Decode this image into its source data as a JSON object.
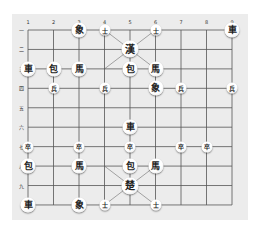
{
  "board": {
    "columns": [
      "1",
      "2",
      "3",
      "4",
      "5",
      "6",
      "7",
      "8",
      "9"
    ],
    "rows": [
      "一",
      "二",
      "三",
      "四",
      "五",
      "六",
      "七",
      "八",
      "九",
      ""
    ],
    "colors": {
      "background": "#ffffff",
      "board": "#ececec",
      "line": "#555555"
    }
  },
  "pieces": [
    {
      "label": "象",
      "col": 3,
      "row": 1,
      "side": "han",
      "size": "medium"
    },
    {
      "label": "士",
      "col": 4,
      "row": 1,
      "side": "han",
      "size": "small"
    },
    {
      "label": "士",
      "col": 6,
      "row": 1,
      "side": "han",
      "size": "small"
    },
    {
      "label": "車",
      "col": 9,
      "row": 1,
      "side": "han",
      "size": "medium"
    },
    {
      "label": "漢",
      "col": 5,
      "row": 2,
      "side": "han",
      "size": "large"
    },
    {
      "label": "車",
      "col": 1,
      "row": 3,
      "side": "han",
      "size": "medium"
    },
    {
      "label": "包",
      "col": 2,
      "row": 3,
      "side": "han",
      "size": "medium"
    },
    {
      "label": "馬",
      "col": 3,
      "row": 3,
      "side": "han",
      "size": "medium"
    },
    {
      "label": "包",
      "col": 5,
      "row": 3,
      "side": "han",
      "size": "medium"
    },
    {
      "label": "馬",
      "col": 6,
      "row": 3,
      "side": "han",
      "size": "medium"
    },
    {
      "label": "兵",
      "col": 2,
      "row": 4,
      "side": "han",
      "size": "small"
    },
    {
      "label": "兵",
      "col": 4,
      "row": 4,
      "side": "han",
      "size": "small"
    },
    {
      "label": "象",
      "col": 6,
      "row": 4,
      "side": "han",
      "size": "medium"
    },
    {
      "label": "兵",
      "col": 7,
      "row": 4,
      "side": "han",
      "size": "small"
    },
    {
      "label": "兵",
      "col": 9,
      "row": 4,
      "side": "han",
      "size": "small"
    },
    {
      "label": "車",
      "col": 5,
      "row": 6,
      "side": "cho",
      "size": "medium"
    },
    {
      "label": "卒",
      "col": 1,
      "row": 7,
      "side": "cho",
      "size": "small"
    },
    {
      "label": "卒",
      "col": 3,
      "row": 7,
      "side": "cho",
      "size": "small"
    },
    {
      "label": "卒",
      "col": 5,
      "row": 7,
      "side": "cho",
      "size": "small"
    },
    {
      "label": "卒",
      "col": 7,
      "row": 7,
      "side": "cho",
      "size": "small"
    },
    {
      "label": "卒",
      "col": 8,
      "row": 7,
      "side": "cho",
      "size": "small"
    },
    {
      "label": "包",
      "col": 1,
      "row": 8,
      "side": "cho",
      "size": "medium"
    },
    {
      "label": "馬",
      "col": 3,
      "row": 8,
      "side": "cho",
      "size": "medium"
    },
    {
      "label": "包",
      "col": 5,
      "row": 8,
      "side": "cho",
      "size": "medium"
    },
    {
      "label": "馬",
      "col": 6,
      "row": 8,
      "side": "cho",
      "size": "medium"
    },
    {
      "label": "楚",
      "col": 5,
      "row": 9,
      "side": "cho",
      "size": "large"
    },
    {
      "label": "車",
      "col": 1,
      "row": 10,
      "side": "cho",
      "size": "medium"
    },
    {
      "label": "象",
      "col": 3,
      "row": 10,
      "side": "cho",
      "size": "medium"
    },
    {
      "label": "士",
      "col": 4,
      "row": 10,
      "side": "cho",
      "size": "small"
    },
    {
      "label": "士",
      "col": 6,
      "row": 10,
      "side": "cho",
      "size": "small"
    }
  ]
}
